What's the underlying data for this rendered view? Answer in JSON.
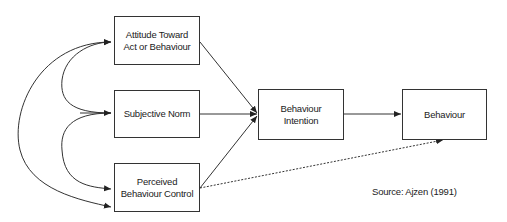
{
  "diagram": {
    "nodes": [
      {
        "id": "attitude",
        "lines": [
          "Attitude Toward",
          "Act or Behaviour"
        ]
      },
      {
        "id": "norm",
        "lines": [
          "Subjective Norm"
        ]
      },
      {
        "id": "pbc",
        "lines": [
          "Perceived",
          "Behaviour Control"
        ]
      },
      {
        "id": "intention",
        "lines": [
          "Behaviour",
          "Intention"
        ]
      },
      {
        "id": "behaviour",
        "lines": [
          "Behaviour"
        ]
      }
    ],
    "edges": [
      {
        "from": "attitude",
        "to": "intention",
        "style": "solid"
      },
      {
        "from": "norm",
        "to": "intention",
        "style": "solid"
      },
      {
        "from": "pbc",
        "to": "intention",
        "style": "solid"
      },
      {
        "from": "intention",
        "to": "behaviour",
        "style": "solid"
      },
      {
        "from": "pbc",
        "to": "behaviour",
        "style": "dotted"
      },
      {
        "from": "norm",
        "to": "attitude",
        "style": "curved-bidirectional"
      },
      {
        "from": "norm",
        "to": "pbc",
        "style": "curved-bidirectional"
      },
      {
        "from": "attitude",
        "to": "pbc",
        "style": "curved-bidirectional"
      }
    ],
    "source": "Source:  Ajzen (1991)"
  }
}
